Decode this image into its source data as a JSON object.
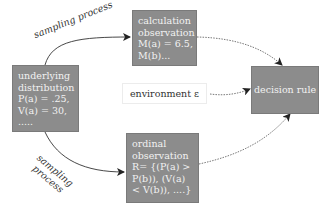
{
  "nodes": {
    "calculation": {
      "lines": [
        "calculation",
        "observation",
        "M(a) = 6.5,",
        "M(b)..."
      ]
    },
    "distribution": {
      "lines": [
        "underlying",
        "distribution",
        "P(a) = .25,",
        "V(a) = 30,",
        "....."
      ]
    },
    "ordinal": {
      "lines": [
        "ordinal",
        "observation",
        "R= {(P(a) >",
        "P(b)), (V(a)",
        "< V(b)), ....}"
      ]
    },
    "decision": {
      "label": "decision rule"
    },
    "environment": {
      "label": "environment ε"
    }
  },
  "edges": {
    "sampling_top": {
      "label": "sampling process"
    },
    "sampling_bottom": {
      "line1": "sampling",
      "line2": "process"
    }
  },
  "colors": {
    "box_fill": "#8c8c8c",
    "box_text": "#f2f2f2",
    "edge": "#333333"
  }
}
